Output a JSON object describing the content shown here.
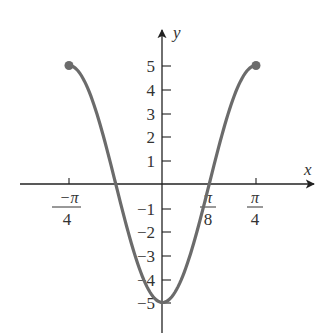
{
  "chart_data": {
    "type": "line",
    "title": "",
    "function": "y = -5 cos(4x)",
    "xlabel": "x",
    "ylabel": "y",
    "xlim": [
      -0.7854,
      0.7854
    ],
    "ylim": [
      -5,
      5
    ],
    "x_ticks": [
      {
        "value": -0.7854,
        "label_num": "−π",
        "label_den": "4"
      },
      {
        "value": 0.3927,
        "label_num": "π",
        "label_den": "8"
      },
      {
        "value": 0.7854,
        "label_num": "π",
        "label_den": "4"
      }
    ],
    "y_ticks": [
      5,
      4,
      3,
      2,
      1,
      -1,
      -2,
      -3,
      -4,
      -5
    ],
    "y_tick_labels": [
      "5",
      "4",
      "3",
      "2",
      "1",
      "-1",
      "-2",
      "-3",
      "-4",
      "-5"
    ],
    "series": [
      {
        "name": "curve",
        "color": "#6b6b6b",
        "x": [
          -0.7854,
          -0.3927,
          0,
          0.3927,
          0.7854
        ],
        "y": [
          5,
          0,
          -5,
          0,
          5
        ]
      }
    ],
    "endpoints": [
      {
        "x": -0.7854,
        "y": 5,
        "closed": true
      },
      {
        "x": 0.7854,
        "y": 5,
        "closed": true
      }
    ],
    "grid": false,
    "legend": null
  },
  "axes": {
    "x_label": "x",
    "y_label": "y"
  },
  "colors": {
    "curve": "#6b6b6b",
    "axis": "#222222",
    "text": "#333333"
  }
}
